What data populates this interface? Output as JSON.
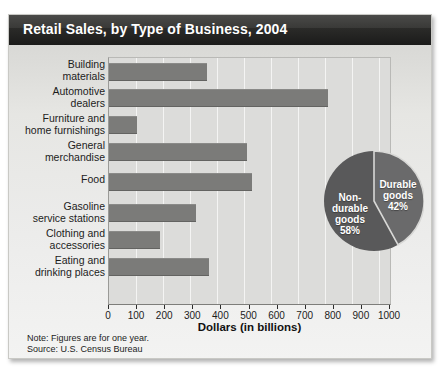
{
  "title": "Retail Sales, by Type of Business, 2004",
  "notes": {
    "note": "Note: Figures are for one year.",
    "source": "Source:  U.S. Census Bureau"
  },
  "colors": {
    "title_bar": "#1b1b1a",
    "panel_bg": "#dcdcda",
    "bar": "#7b7b79",
    "pie_nondurable": "#59595a",
    "pie_durable": "#646465",
    "gridline": "#f4f4f3"
  },
  "chart_data": {
    "type": "bar",
    "orientation": "horizontal",
    "title": "Retail Sales, by Type of Business, 2004",
    "xlabel": "Dollars (in billions)",
    "ylabel": "",
    "xlim": [
      0,
      1000
    ],
    "xticks": [
      0,
      100,
      200,
      300,
      400,
      500,
      600,
      700,
      800,
      900,
      1000
    ],
    "grid": true,
    "legend": "none",
    "categories": [
      "Building\nmaterials",
      "Automotive\ndealers",
      "Furniture and\nhome furnishings",
      "General\nmerchandise",
      "Food",
      "Gasoline\nservice stations",
      "Clothing and\naccessories",
      "Eating and\ndrinking places"
    ],
    "values": [
      350,
      780,
      100,
      490,
      510,
      310,
      180,
      355
    ],
    "units": "billions of dollars"
  },
  "pie_data": {
    "type": "pie",
    "slices": [
      {
        "label": "Non-\ndurable\ngoods",
        "percent_label": "58%",
        "value": 58
      },
      {
        "label": "Durable\ngoods",
        "percent_label": "42%",
        "value": 42
      }
    ]
  }
}
